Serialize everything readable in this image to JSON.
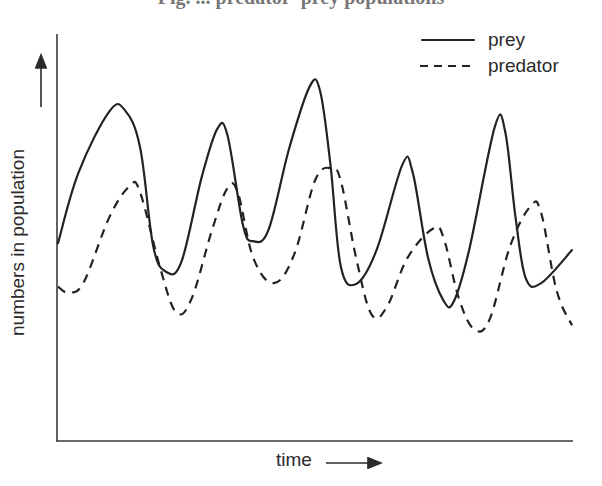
{
  "title_cropped": "Fig. ... predator–prey populations",
  "colors": {
    "line": "#222222",
    "axis": "#3a3a3a",
    "background": "#ffffff"
  },
  "legend": {
    "items": [
      {
        "label": "prey",
        "style": "solid"
      },
      {
        "label": "predator",
        "style": "dashed"
      }
    ]
  },
  "axes": {
    "x_label": "time",
    "y_label": "numbers in population"
  },
  "chart_data": {
    "type": "line",
    "title": "",
    "xlabel": "time",
    "ylabel": "numbers in population",
    "grid": false,
    "legend_position": "top-right",
    "axis_ticks": "none (qualitative axes, arrows indicate increasing direction)",
    "units": "relative (0 = x-axis, 100 = top of y-axis); x as % of time axis",
    "series": [
      {
        "name": "prey",
        "style": "solid",
        "points": [
          [
            0,
            48.6
          ],
          [
            4,
            66
          ],
          [
            10,
            81
          ],
          [
            13,
            81.3
          ],
          [
            16,
            72
          ],
          [
            18.5,
            48
          ],
          [
            21,
            41.6
          ],
          [
            24,
            44
          ],
          [
            28,
            65
          ],
          [
            31,
            76.7
          ],
          [
            33,
            75
          ],
          [
            36,
            53
          ],
          [
            38,
            49.1
          ],
          [
            41,
            52
          ],
          [
            45,
            72
          ],
          [
            49,
            87.2
          ],
          [
            51,
            86
          ],
          [
            53,
            68
          ],
          [
            55,
            43
          ],
          [
            58,
            38.6
          ],
          [
            62,
            47
          ],
          [
            67,
            67.9
          ],
          [
            69,
            66
          ],
          [
            72,
            45
          ],
          [
            75,
            34.5
          ],
          [
            77,
            34.3
          ],
          [
            80,
            47
          ],
          [
            85,
            77.3
          ],
          [
            87,
            76
          ],
          [
            89,
            55
          ],
          [
            91,
            40
          ],
          [
            94,
            38.8
          ],
          [
            100,
            46.9
          ]
        ]
      },
      {
        "name": "predator",
        "style": "dashed",
        "points": [
          [
            0,
            37.9
          ],
          [
            2,
            36.5
          ],
          [
            5,
            39
          ],
          [
            10,
            55
          ],
          [
            14,
            62.7
          ],
          [
            16,
            61
          ],
          [
            20,
            42
          ],
          [
            23,
            31.6
          ],
          [
            26,
            35
          ],
          [
            30,
            52
          ],
          [
            33,
            62.2
          ],
          [
            35,
            61
          ],
          [
            38,
            45
          ],
          [
            42,
            38.8
          ],
          [
            46,
            46
          ],
          [
            50,
            64
          ],
          [
            53,
            67.1
          ],
          [
            55,
            64
          ],
          [
            58,
            45
          ],
          [
            61,
            31.1
          ],
          [
            64,
            33
          ],
          [
            68,
            45
          ],
          [
            73,
            52.2
          ],
          [
            75,
            50
          ],
          [
            78,
            35
          ],
          [
            81,
            27.4
          ],
          [
            84,
            30
          ],
          [
            88,
            48
          ],
          [
            92,
            57.8
          ],
          [
            94,
            56
          ],
          [
            97,
            37
          ],
          [
            100,
            28.4
          ]
        ]
      }
    ]
  }
}
